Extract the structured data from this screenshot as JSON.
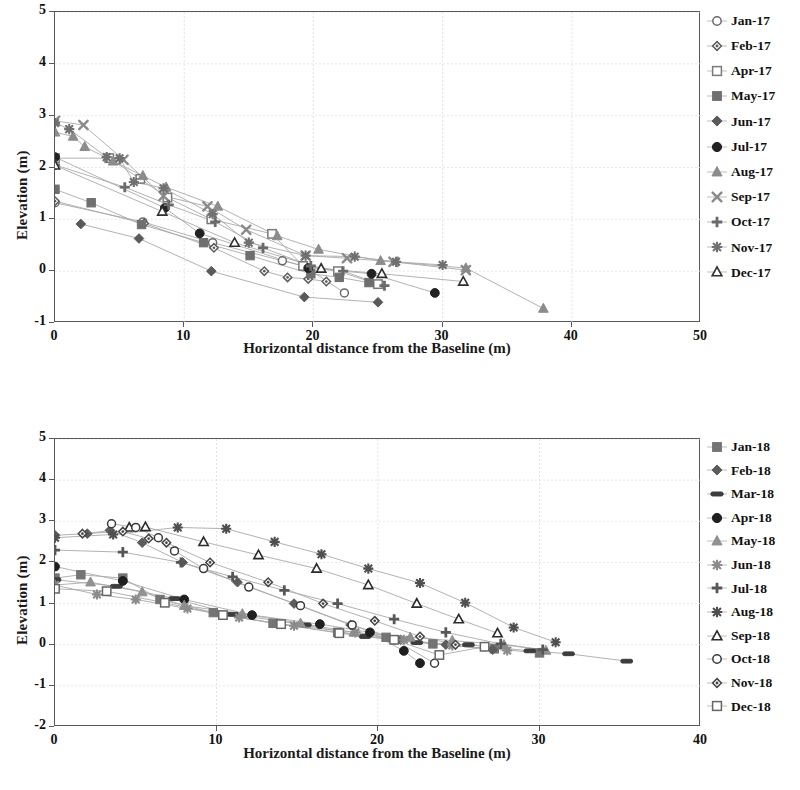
{
  "chart_data": [
    {
      "id": "chart1",
      "type": "scatter",
      "title": "",
      "xlabel": "Horizontal distance from the Baseline (m)",
      "ylabel": "Elevation (m)",
      "xlim": [
        0,
        50
      ],
      "ylim": [
        -1,
        5
      ],
      "xticks": [
        0,
        10,
        20,
        30,
        40,
        50
      ],
      "yticks": [
        -1,
        0,
        1,
        2,
        3,
        4,
        5
      ],
      "grid": true,
      "legend_position": "right",
      "series": [
        {
          "name": "Jan-17",
          "marker": "open-circle",
          "color": "#6b6b6b",
          "points": [
            [
              0,
              1.32
            ],
            [
              6.8,
              0.95
            ],
            [
              12.2,
              0.55
            ],
            [
              17.6,
              0.2
            ],
            [
              19.3,
              0.1
            ],
            [
              22.4,
              -0.42
            ]
          ]
        },
        {
          "name": "Feb-17",
          "marker": "open-diamond-small",
          "color": "#5d5d5d",
          "points": [
            [
              0,
              1.35
            ],
            [
              6.9,
              0.92
            ],
            [
              12.3,
              0.45
            ],
            [
              16.2,
              0.0
            ],
            [
              18.0,
              -0.12
            ],
            [
              19.6,
              -0.15
            ],
            [
              21.0,
              -0.2
            ]
          ]
        },
        {
          "name": "Apr-17",
          "marker": "open-square",
          "color": "#7a7a7a",
          "points": [
            [
              0,
              2.18
            ],
            [
              4.2,
              2.18
            ],
            [
              6.6,
              1.78
            ],
            [
              8.7,
              1.42
            ],
            [
              12.1,
              1.0
            ],
            [
              16.8,
              0.72
            ],
            [
              19.2,
              0.1
            ],
            [
              21.9,
              0.0
            ],
            [
              25.0,
              -0.25
            ]
          ]
        },
        {
          "name": "May-17",
          "marker": "filled-square",
          "color": "#6f6f6f",
          "points": [
            [
              0,
              1.58
            ],
            [
              2.8,
              1.32
            ],
            [
              6.7,
              0.9
            ],
            [
              11.5,
              0.55
            ],
            [
              15.1,
              0.3
            ],
            [
              19.8,
              -0.05
            ],
            [
              22.0,
              -0.12
            ],
            [
              24.3,
              -0.22
            ]
          ]
        },
        {
          "name": "Jun-17",
          "marker": "filled-diamond",
          "color": "#5a5a5a",
          "points": [
            [
              2.0,
              0.91
            ],
            [
              6.5,
              0.63
            ],
            [
              12.1,
              0.0
            ],
            [
              19.3,
              -0.5
            ],
            [
              25.0,
              -0.6
            ]
          ]
        },
        {
          "name": "Jul-17",
          "marker": "filled-circle",
          "color": "#222222",
          "points": [
            [
              0,
              2.2
            ],
            [
              8.5,
              1.22
            ],
            [
              11.2,
              0.73
            ],
            [
              19.6,
              0.06
            ],
            [
              24.5,
              -0.05
            ],
            [
              29.4,
              -0.42
            ]
          ]
        },
        {
          "name": "Aug-17",
          "marker": "filled-triangle",
          "color": "#8c8c8c",
          "points": [
            [
              0,
              2.68
            ],
            [
              1.4,
              2.6
            ],
            [
              2.3,
              2.4
            ],
            [
              4.5,
              2.12
            ],
            [
              6.8,
              1.84
            ],
            [
              8.6,
              1.62
            ],
            [
              12.6,
              1.25
            ],
            [
              17.2,
              0.68
            ],
            [
              20.4,
              0.42
            ],
            [
              25.2,
              0.2
            ],
            [
              31.8,
              0.06
            ],
            [
              37.8,
              -0.72
            ]
          ]
        },
        {
          "name": "Sep-17",
          "marker": "x-cross",
          "color": "#8a8a8a",
          "points": [
            [
              0,
              2.9
            ],
            [
              2.2,
              2.82
            ],
            [
              5.3,
              2.15
            ],
            [
              8.4,
              1.45
            ],
            [
              11.8,
              1.25
            ],
            [
              14.8,
              0.8
            ],
            [
              19.4,
              0.3
            ],
            [
              22.6,
              0.25
            ],
            [
              26.2,
              0.18
            ],
            [
              31.8,
              0.02
            ]
          ]
        },
        {
          "name": "Oct-17",
          "marker": "plus",
          "color": "#6a6a6a",
          "points": [
            [
              0,
              2.05
            ],
            [
              5.4,
              1.62
            ],
            [
              8.8,
              1.28
            ],
            [
              12.4,
              0.95
            ],
            [
              16.1,
              0.45
            ],
            [
              19.8,
              0.1
            ],
            [
              22.3,
              0.0
            ],
            [
              25.5,
              -0.28
            ]
          ]
        },
        {
          "name": "Nov-17",
          "marker": "star-burst",
          "color": "#707070",
          "points": [
            [
              0,
              2.86
            ],
            [
              1.1,
              2.74
            ],
            [
              4.0,
              2.2
            ],
            [
              5.0,
              2.18
            ],
            [
              6.1,
              1.72
            ],
            [
              8.4,
              1.6
            ],
            [
              12.2,
              1.1
            ],
            [
              15.0,
              0.55
            ],
            [
              19.4,
              0.3
            ],
            [
              23.2,
              0.28
            ],
            [
              26.4,
              0.18
            ],
            [
              30.0,
              0.12
            ]
          ]
        },
        {
          "name": "Dec-17",
          "marker": "open-triangle",
          "color": "#2f2f2f",
          "points": [
            [
              0,
              2.04
            ],
            [
              8.3,
              1.15
            ],
            [
              13.9,
              0.55
            ],
            [
              20.6,
              0.05
            ],
            [
              25.3,
              -0.05
            ],
            [
              31.6,
              -0.2
            ]
          ]
        }
      ]
    },
    {
      "id": "chart2",
      "type": "scatter",
      "title": "",
      "xlabel": "Horizontal distance from the Baseline (m)",
      "ylabel": "Elevation (m)",
      "xlim": [
        0,
        40
      ],
      "ylim": [
        -2,
        5
      ],
      "xticks": [
        0,
        10,
        20,
        30,
        40
      ],
      "yticks": [
        -2,
        -1,
        0,
        1,
        2,
        3,
        4,
        5
      ],
      "grid": true,
      "legend_position": "right",
      "series": [
        {
          "name": "Jan-18",
          "marker": "filled-square",
          "color": "#747474",
          "points": [
            [
              0,
              1.62
            ],
            [
              1.6,
              1.7
            ],
            [
              4.2,
              1.62
            ],
            [
              6.5,
              1.1
            ],
            [
              9.8,
              0.78
            ],
            [
              13.5,
              0.52
            ],
            [
              17.5,
              0.3
            ],
            [
              20.5,
              0.18
            ],
            [
              23.4,
              0.02
            ],
            [
              27.2,
              -0.1
            ],
            [
              30.0,
              -0.2
            ]
          ]
        },
        {
          "name": "Feb-18",
          "marker": "filled-diamond",
          "color": "#5c5c5c",
          "points": [
            [
              0,
              2.66
            ],
            [
              2.0,
              2.7
            ],
            [
              3.4,
              2.78
            ],
            [
              5.4,
              2.48
            ],
            [
              7.9,
              2.0
            ],
            [
              11.3,
              1.52
            ],
            [
              14.8,
              1.0
            ],
            [
              18.3,
              0.48
            ],
            [
              21.4,
              0.12
            ],
            [
              24.2,
              0.0
            ],
            [
              27.1,
              -0.12
            ]
          ]
        },
        {
          "name": "Mar-18",
          "marker": "dash",
          "color": "#3d3d3d",
          "points": [
            [
              0,
              1.58
            ],
            [
              3.8,
              1.42
            ],
            [
              7.4,
              1.12
            ],
            [
              11.0,
              0.74
            ],
            [
              15.5,
              0.48
            ],
            [
              19.2,
              0.2
            ],
            [
              22.4,
              0.05
            ],
            [
              25.6,
              0.0
            ],
            [
              29.4,
              -0.15
            ],
            [
              31.8,
              -0.22
            ],
            [
              35.4,
              -0.4
            ]
          ]
        },
        {
          "name": "Apr-18",
          "marker": "filled-circle",
          "color": "#1f1f1f",
          "points": [
            [
              0,
              1.9
            ],
            [
              4.2,
              1.55
            ],
            [
              8.0,
              1.1
            ],
            [
              12.2,
              0.72
            ],
            [
              16.4,
              0.5
            ],
            [
              19.5,
              0.3
            ],
            [
              21.6,
              -0.15
            ],
            [
              22.6,
              -0.45
            ]
          ]
        },
        {
          "name": "May-18",
          "marker": "filled-triangle",
          "color": "#919191",
          "points": [
            [
              0,
              1.45
            ],
            [
              2.2,
              1.52
            ],
            [
              5.4,
              1.28
            ],
            [
              8.0,
              0.95
            ],
            [
              11.6,
              0.75
            ],
            [
              15.2,
              0.52
            ],
            [
              18.5,
              0.3
            ],
            [
              22.0,
              0.18
            ],
            [
              24.6,
              0.1
            ],
            [
              27.8,
              0.0
            ],
            [
              30.4,
              -0.14
            ]
          ]
        },
        {
          "name": "Jun-18",
          "marker": "star-burst",
          "color": "#8b8b8b",
          "points": [
            [
              0,
              1.45
            ],
            [
              2.6,
              1.22
            ],
            [
              5.0,
              1.1
            ],
            [
              8.2,
              0.88
            ],
            [
              11.4,
              0.66
            ],
            [
              14.8,
              0.46
            ],
            [
              18.6,
              0.3
            ],
            [
              21.6,
              0.12
            ],
            [
              24.6,
              -0.02
            ],
            [
              28.0,
              -0.14
            ]
          ]
        },
        {
          "name": "Jul-18",
          "marker": "plus",
          "color": "#575757",
          "points": [
            [
              0,
              2.3
            ],
            [
              4.2,
              2.25
            ],
            [
              7.8,
              2.0
            ],
            [
              11.0,
              1.65
            ],
            [
              14.2,
              1.32
            ],
            [
              17.5,
              1.0
            ],
            [
              21.0,
              0.62
            ],
            [
              24.2,
              0.3
            ],
            [
              27.6,
              0.02
            ],
            [
              30.2,
              -0.12
            ]
          ]
        },
        {
          "name": "Aug-18",
          "marker": "star-burst",
          "color": "#4f4f4f",
          "points": [
            [
              0,
              2.6
            ],
            [
              3.6,
              2.68
            ],
            [
              7.6,
              2.85
            ],
            [
              10.6,
              2.82
            ],
            [
              13.6,
              2.5
            ],
            [
              16.5,
              2.2
            ],
            [
              19.4,
              1.85
            ],
            [
              22.6,
              1.5
            ],
            [
              25.4,
              1.02
            ],
            [
              28.4,
              0.42
            ],
            [
              31.0,
              0.06
            ]
          ]
        },
        {
          "name": "Sep-18",
          "marker": "open-triangle",
          "color": "#2b2b2b",
          "points": [
            [
              4.6,
              2.85
            ],
            [
              5.6,
              2.86
            ],
            [
              9.2,
              2.5
            ],
            [
              12.6,
              2.18
            ],
            [
              16.2,
              1.85
            ],
            [
              19.4,
              1.45
            ],
            [
              22.4,
              1.0
            ],
            [
              25.0,
              0.62
            ],
            [
              27.4,
              0.28
            ]
          ]
        },
        {
          "name": "Oct-18",
          "marker": "open-circle",
          "color": "#3a3a3a",
          "points": [
            [
              3.5,
              2.94
            ],
            [
              5.0,
              2.85
            ],
            [
              6.4,
              2.6
            ],
            [
              7.4,
              2.28
            ],
            [
              9.2,
              1.85
            ],
            [
              12.0,
              1.4
            ],
            [
              15.2,
              0.95
            ],
            [
              18.4,
              0.48
            ],
            [
              21.0,
              0.12
            ],
            [
              23.5,
              -0.45
            ]
          ]
        },
        {
          "name": "Nov-18",
          "marker": "open-diamond-small",
          "color": "#444444",
          "points": [
            [
              1.7,
              2.7
            ],
            [
              4.2,
              2.75
            ],
            [
              5.8,
              2.58
            ],
            [
              6.9,
              2.48
            ],
            [
              9.6,
              2.0
            ],
            [
              13.2,
              1.52
            ],
            [
              16.6,
              1.0
            ],
            [
              19.8,
              0.58
            ],
            [
              22.6,
              0.2
            ],
            [
              24.8,
              0.0
            ]
          ]
        },
        {
          "name": "Dec-18",
          "marker": "open-square",
          "color": "#666666",
          "points": [
            [
              0,
              1.36
            ],
            [
              3.2,
              1.3
            ],
            [
              6.8,
              1.02
            ],
            [
              10.4,
              0.72
            ],
            [
              14.0,
              0.5
            ],
            [
              17.6,
              0.28
            ],
            [
              21.0,
              0.12
            ],
            [
              23.8,
              -0.25
            ],
            [
              26.6,
              -0.05
            ]
          ]
        }
      ]
    }
  ]
}
